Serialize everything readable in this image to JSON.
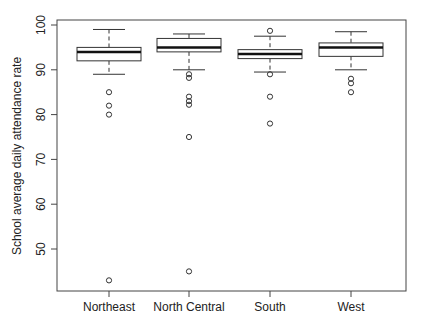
{
  "chart_data": {
    "type": "boxplot",
    "title": "",
    "xlabel": "",
    "ylabel": "School average daily attendance rate",
    "ylim": [
      41,
      100.5
    ],
    "yticks": [
      50,
      60,
      70,
      80,
      90,
      100
    ],
    "grid": false,
    "legend": null,
    "categories": [
      "Northeast",
      "North Central",
      "South",
      "West"
    ],
    "series": [
      {
        "name": "Northeast",
        "whisker_low": 89,
        "q1": 92,
        "median": 94,
        "q3": 95,
        "whisker_high": 99,
        "outliers": [
          85,
          82,
          80,
          43
        ]
      },
      {
        "name": "North Central",
        "whisker_low": 90,
        "q1": 94,
        "median": 95,
        "q3": 97,
        "whisker_high": 98,
        "outliers": [
          89,
          88.2,
          84,
          83,
          82.2,
          75,
          45
        ]
      },
      {
        "name": "South",
        "whisker_low": 89.5,
        "q1": 92.5,
        "median": 93.5,
        "q3": 94.5,
        "whisker_high": 97.5,
        "outliers": [
          98.7,
          89,
          84,
          78
        ]
      },
      {
        "name": "West",
        "whisker_low": 90,
        "q1": 93,
        "median": 95,
        "q3": 96,
        "whisker_high": 98.5,
        "outliers": [
          88,
          87,
          85
        ]
      }
    ]
  },
  "colors": {
    "stroke": "#333333",
    "median": "#111111",
    "background": "#ffffff"
  }
}
